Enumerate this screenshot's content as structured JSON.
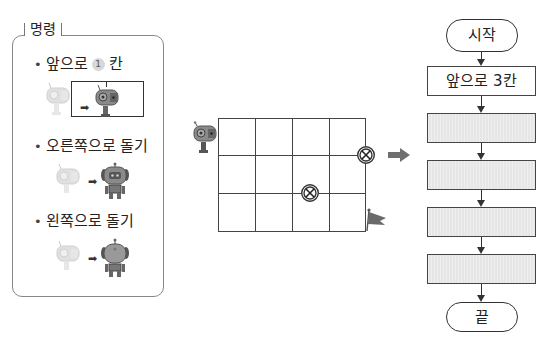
{
  "commands_panel": {
    "title": "명령",
    "items": [
      {
        "bullet": "•",
        "label_before": "앞으로",
        "number": "1",
        "label_after": "칸",
        "icon": "robot-move-forward-one-cell"
      },
      {
        "bullet": "•",
        "label": "오른쪽으로 돌기",
        "icon": "robot-turn-right"
      },
      {
        "bullet": "•",
        "label": "왼쪽으로 돌기",
        "icon": "robot-turn-left"
      }
    ]
  },
  "grid": {
    "columns": 4,
    "rows": 3,
    "robot_start": "left of top-left cell, facing right",
    "obstacles": [
      {
        "position": "right edge, between row 1 and row 2",
        "icon": "x-circle-obstacle-icon"
      },
      {
        "position": "intersection of column 3 line and row 2-3 line",
        "icon": "x-circle-obstacle-icon"
      }
    ],
    "goal": {
      "position": "bottom-right corner",
      "icon": "flag-icon"
    }
  },
  "flowchart": {
    "start": "시작",
    "steps": [
      {
        "label": "앞으로 3칸",
        "blank": false
      },
      {
        "label": "",
        "blank": true
      },
      {
        "label": "",
        "blank": true
      },
      {
        "label": "",
        "blank": true
      },
      {
        "label": "",
        "blank": true
      }
    ],
    "end": "끝"
  },
  "colors": {
    "line": "#333333",
    "blank_box_fill": "#e6e6e6",
    "robot_body": "#8a8a8a",
    "arrow": "#6f6f6f"
  }
}
